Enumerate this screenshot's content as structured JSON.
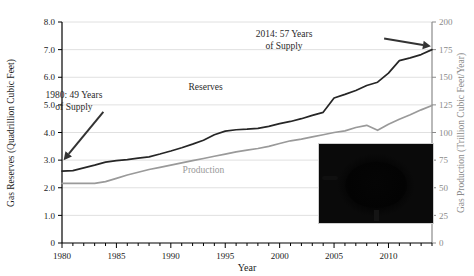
{
  "chart_data": {
    "type": "line",
    "title": "",
    "xlabel": "Year",
    "ylabel_left": "Gas Reserves (Quadrillion Cubic Feet)",
    "ylabel_right": "Gas Production (Trillion Cubic Feet/Year)",
    "xlim": [
      1980,
      2014
    ],
    "ylim_left": [
      0,
      8.0
    ],
    "ylim_right": [
      0,
      200
    ],
    "grid": "horizontal",
    "legend": "inline-labels",
    "x_tick_labels": [
      "1980",
      "1985",
      "1990",
      "1995",
      "2000",
      "2005",
      "2010"
    ],
    "x_tick_values": [
      1980,
      1985,
      1990,
      1995,
      2000,
      2005,
      2010
    ],
    "x_minor_tick_step": 1,
    "y_left_tick_labels": [
      "0",
      "1.0",
      "2.0",
      "3.0",
      "4.0",
      "5.0",
      "6.0",
      "7.0",
      "8.0"
    ],
    "y_left_tick_values": [
      0,
      1.0,
      2.0,
      3.0,
      4.0,
      5.0,
      6.0,
      7.0,
      8.0
    ],
    "y_right_tick_labels": [
      "0",
      "25",
      "50",
      "75",
      "100",
      "125",
      "150",
      "175",
      "200"
    ],
    "y_right_tick_values": [
      0,
      25,
      50,
      75,
      100,
      125,
      150,
      175,
      200
    ],
    "x": [
      1980,
      1981,
      1982,
      1983,
      1984,
      1985,
      1986,
      1987,
      1988,
      1989,
      1990,
      1991,
      1992,
      1993,
      1994,
      1995,
      1996,
      1997,
      1998,
      1999,
      2000,
      2001,
      2002,
      2003,
      2004,
      2005,
      2006,
      2007,
      2008,
      2009,
      2010,
      2011,
      2012,
      2013,
      2014
    ],
    "series": [
      {
        "name": "Reserves",
        "axis": "left",
        "units": "Quadrillion Cubic Feet",
        "color": "#262626",
        "label_position": {
          "x": 1993.2,
          "y": 5.55
        },
        "values": [
          2.6,
          2.62,
          2.72,
          2.82,
          2.93,
          2.98,
          3.02,
          3.07,
          3.12,
          3.22,
          3.33,
          3.45,
          3.58,
          3.72,
          3.92,
          4.05,
          4.1,
          4.12,
          4.15,
          4.22,
          4.32,
          4.4,
          4.5,
          4.62,
          4.73,
          5.25,
          5.38,
          5.52,
          5.7,
          5.82,
          6.15,
          6.6,
          6.7,
          6.82,
          7.0
        ]
      },
      {
        "name": "Production",
        "axis": "right",
        "units": "Trillion Cubic Feet/Year",
        "color": "#9a9a9a",
        "label_position": {
          "x": 1993.0,
          "y": 2.55
        },
        "values": [
          54.0,
          54.0,
          54.0,
          54.0,
          55.5,
          58.5,
          61.5,
          64.0,
          66.5,
          68.5,
          70.5,
          72.5,
          74.5,
          76.5,
          78.5,
          80.5,
          82.5,
          84.0,
          85.5,
          87.5,
          90.0,
          92.5,
          94.0,
          96.0,
          98.0,
          100.0,
          101.5,
          104.5,
          106.5,
          102.0,
          107.5,
          112.0,
          116.0,
          120.5,
          124.5
        ]
      }
    ],
    "annotations": [
      {
        "name": "annotation-1980",
        "lines": [
          "1980:  49 Years",
          "of Supply"
        ],
        "text_x": 1981.1,
        "text_y": 5.25,
        "arrow_from": {
          "x": 1983.8,
          "y": 4.75
        },
        "arrow_to": {
          "x": 1980.15,
          "y": 3.0
        }
      },
      {
        "name": "annotation-2014",
        "lines": [
          "2014:  57 Years",
          "of Supply"
        ],
        "text_x": 2000.4,
        "text_y": 7.45,
        "arrow_from": {
          "x": 2009.6,
          "y": 7.4
        },
        "arrow_to": {
          "x": 2013.9,
          "y": 7.12
        }
      }
    ],
    "inset": {
      "name": "gas-burner-photo",
      "description": "photograph of a lit gas stove burner ring",
      "x": 318,
      "y": 143,
      "width": 114,
      "height": 79
    }
  },
  "axes": {
    "left": {
      "title": "Gas Reserves (Quadrillion Cubic Feet)",
      "color": "#1a1a1a"
    },
    "right": {
      "title": "Gas Production (Trillion Cubic Feet/Year)",
      "color": "#8a8a8a"
    },
    "bottom": {
      "title": "Year",
      "color": "#1a1a1a"
    }
  }
}
